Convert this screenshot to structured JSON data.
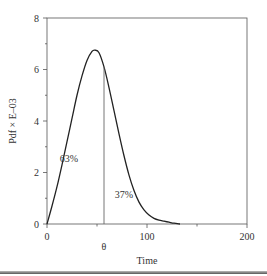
{
  "chart_data": {
    "type": "line",
    "title": "",
    "xlabel": "Time",
    "ylabel": "Pdf × E–03",
    "xlim": [
      0,
      200
    ],
    "ylim": [
      0,
      8
    ],
    "x_ticks": [
      0,
      100,
      200
    ],
    "x_minor_ticks": [
      50,
      150
    ],
    "y_ticks": [
      0,
      2,
      4,
      6,
      8
    ],
    "y_minor_ticks": [
      1,
      3,
      5,
      7
    ],
    "grid": false,
    "series": [
      {
        "name": "pdf",
        "x": [
          0,
          5,
          10,
          15,
          20,
          25,
          30,
          35,
          40,
          45,
          48,
          52,
          57,
          62,
          67,
          72,
          77,
          82,
          87,
          92,
          97,
          102,
          107,
          112,
          117,
          122,
          127,
          133
        ],
        "values": [
          0,
          0.7,
          1.45,
          2.3,
          3.2,
          4.1,
          5.0,
          5.75,
          6.35,
          6.7,
          6.75,
          6.65,
          6.1,
          5.3,
          4.4,
          3.5,
          2.65,
          1.9,
          1.3,
          0.85,
          0.55,
          0.35,
          0.22,
          0.15,
          0.11,
          0.07,
          0.03,
          0
        ]
      }
    ],
    "annotations": [
      {
        "text": "63%",
        "x": 22,
        "y": 2.4
      },
      {
        "text": "37%",
        "x": 77,
        "y": 1.0
      },
      {
        "text": "θ",
        "x": 57,
        "y": -0.9,
        "type": "vertical-line-label",
        "line_x": 57
      }
    ]
  },
  "colors": {
    "curve": "#222222",
    "axis": "#555555",
    "text": "#333333",
    "theta_line": "#666666"
  }
}
